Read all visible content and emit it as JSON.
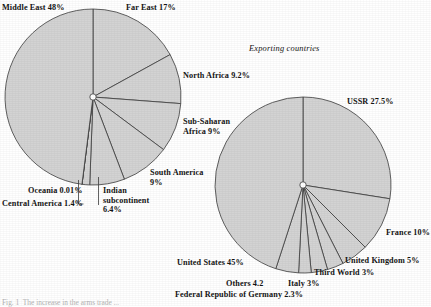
{
  "figure": {
    "background": "#ffffff",
    "slice_fill": "#d3d3d3",
    "slice_stroke": "#3c3c3c",
    "caption": "Fig. 1  The increase in the arms trade ..."
  },
  "chart_data": [
    {
      "type": "pie",
      "name": "importing-regions",
      "title": "",
      "center": [
        93,
        97
      ],
      "radius": 88,
      "start_angle_deg": 0,
      "direction": "clockwise",
      "categories": [
        "Far East",
        "North Africa",
        "Sub-Saharan Africa",
        "South America",
        "Indian subcontinent",
        "Central America",
        "Oceania",
        "Middle East"
      ],
      "values": [
        17,
        9.2,
        9,
        9,
        6.4,
        1.4,
        0.01,
        48
      ],
      "labels": [
        {
          "key": "middle-east",
          "text": "Middle East 48%",
          "x": 2,
          "y": 3,
          "align": "left"
        },
        {
          "key": "far-east",
          "text": "Far East 17%",
          "x": 126,
          "y": 3,
          "align": "left"
        },
        {
          "key": "north-africa",
          "text": "North Africa 9.2%",
          "x": 183,
          "y": 71,
          "align": "left"
        },
        {
          "key": "sub-saharan-africa",
          "text": "Sub-Saharan\nAfrica 9%",
          "x": 183,
          "y": 117,
          "align": "left"
        },
        {
          "key": "south-america",
          "text": "South America\n9%",
          "x": 150,
          "y": 168,
          "align": "left"
        },
        {
          "key": "indian-subcontinent",
          "text": "Indian\nsubcontinent\n6.4%",
          "x": 103,
          "y": 186,
          "align": "left"
        },
        {
          "key": "oceania",
          "text": "Oceania 0.01%",
          "x": 28,
          "y": 186,
          "align": "left"
        },
        {
          "key": "central-america",
          "text": "Central America 1.4%",
          "x": 2,
          "y": 199,
          "align": "left"
        }
      ]
    },
    {
      "type": "pie",
      "name": "exporting-countries",
      "title": "Exporting countries",
      "title_pos": [
        249,
        44
      ],
      "center": [
        303,
        185
      ],
      "radius": 88,
      "start_angle_deg": 0,
      "direction": "clockwise",
      "categories": [
        "USSR",
        "France",
        "United Kingdom",
        "Third World",
        "Italy",
        "Federal Republic of Germany",
        "Others",
        "United States"
      ],
      "values": [
        27.5,
        10,
        5,
        3,
        3,
        2.3,
        4.2,
        45
      ],
      "labels": [
        {
          "key": "ussr",
          "text": "USSR 27.5%",
          "x": 347,
          "y": 97,
          "align": "left"
        },
        {
          "key": "france",
          "text": "France 10%",
          "x": 386,
          "y": 228,
          "align": "left"
        },
        {
          "key": "united-kingdom",
          "text": "United Kingdom 5%",
          "x": 345,
          "y": 256,
          "align": "left"
        },
        {
          "key": "third-world",
          "text": "Third World 3%",
          "x": 314,
          "y": 268,
          "align": "left"
        },
        {
          "key": "italy",
          "text": "Italy 3%",
          "x": 288,
          "y": 279,
          "align": "left"
        },
        {
          "key": "frg",
          "text": "Federal Republic of Germany 2.3%",
          "x": 175,
          "y": 290,
          "align": "left"
        },
        {
          "key": "others",
          "text": "Others 4.2",
          "x": 226,
          "y": 279,
          "align": "left"
        },
        {
          "key": "united-states",
          "text": "United States 45%",
          "x": 177,
          "y": 258,
          "align": "left"
        }
      ]
    }
  ]
}
